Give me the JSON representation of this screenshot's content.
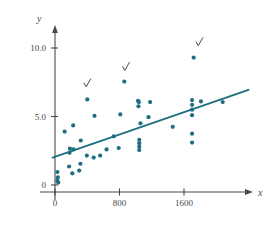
{
  "chart_data": {
    "type": "scatter",
    "title": "",
    "xlabel": "x",
    "ylabel": "y",
    "xlim": [
      -120,
      2400
    ],
    "ylim": [
      -0.9,
      10.6
    ],
    "xticks": [
      0,
      800,
      1600
    ],
    "xtick_labels": [
      "0",
      "800",
      "1600"
    ],
    "yticks": [
      0,
      5.0,
      10.0
    ],
    "ytick_labels": [
      "0",
      "5.0",
      "10.0"
    ],
    "grid": false,
    "legend": null,
    "marker_color": "#1f6f82",
    "line_color": "#1f6f82",
    "axis_color": "#4a4a4a",
    "points": [
      [
        30,
        0.95
      ],
      [
        35,
        0.55
      ],
      [
        30,
        0.3
      ],
      [
        40,
        0.18
      ],
      [
        120,
        3.9
      ],
      [
        175,
        1.35
      ],
      [
        180,
        2.35
      ],
      [
        185,
        2.65
      ],
      [
        215,
        0.85
      ],
      [
        225,
        4.35
      ],
      [
        230,
        2.6
      ],
      [
        300,
        1.05
      ],
      [
        315,
        1.55
      ],
      [
        320,
        3.25
      ],
      [
        395,
        2.15
      ],
      [
        400,
        6.25
      ],
      [
        480,
        2.0
      ],
      [
        490,
        5.05
      ],
      [
        560,
        2.15
      ],
      [
        640,
        2.6
      ],
      [
        730,
        3.55
      ],
      [
        790,
        2.7
      ],
      [
        810,
        5.15
      ],
      [
        860,
        7.55
      ],
      [
        1030,
        6.15
      ],
      [
        1035,
        5.75
      ],
      [
        1040,
        6.05
      ],
      [
        1060,
        4.5
      ],
      [
        1045,
        3.3
      ],
      [
        1045,
        3.05
      ],
      [
        1045,
        2.8
      ],
      [
        1045,
        2.55
      ],
      [
        1160,
        4.95
      ],
      [
        1180,
        6.05
      ],
      [
        1460,
        4.25
      ],
      [
        1700,
        6.2
      ],
      [
        1700,
        5.85
      ],
      [
        1700,
        5.5
      ],
      [
        1700,
        5.1
      ],
      [
        1700,
        3.75
      ],
      [
        1700,
        3.1
      ],
      [
        1720,
        9.3
      ],
      [
        1810,
        6.1
      ],
      [
        2080,
        6.05
      ]
    ],
    "regression_line": {
      "x0": -30,
      "y0": 2.0,
      "x1": 2400,
      "y1": 6.95
    },
    "annotations": [
      {
        "symbol": "check",
        "x": 400,
        "y": 7.35,
        "note": "outlier-mark-1"
      },
      {
        "symbol": "check",
        "x": 880,
        "y": 8.55,
        "note": "outlier-mark-2"
      },
      {
        "symbol": "check",
        "x": 1790,
        "y": 10.35,
        "note": "outlier-mark-3"
      }
    ]
  }
}
